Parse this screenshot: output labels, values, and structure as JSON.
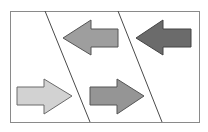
{
  "diagram": {
    "background": "#ffffff",
    "frame": {
      "x": 10,
      "y": 11,
      "width": 189,
      "height": 111,
      "stroke": "#8a8a8a"
    },
    "dividers": [
      {
        "x1": 45,
        "y1": 11,
        "x2": 90,
        "y2": 122,
        "stroke": "#4a4a4a"
      },
      {
        "x1": 118,
        "y1": 11,
        "x2": 162,
        "y2": 122,
        "stroke": "#4a4a4a"
      }
    ],
    "arrows": [
      {
        "id": "arrow-top-middle",
        "direction": "left",
        "fill": "#9e9e9e",
        "stroke": "#555555",
        "points": "63,38 91,20 91,29 118,29 118,47 91,47 91,55"
      },
      {
        "id": "arrow-top-right",
        "direction": "left",
        "fill": "#6b6b6b",
        "stroke": "#444444",
        "points": "136,38 163,20 163,29 191,29 191,47 163,47 163,55"
      },
      {
        "id": "arrow-bottom-left",
        "direction": "right",
        "fill": "#d2d2d2",
        "stroke": "#6a6a6a",
        "points": "17,87 44,87 44,79 72,96 44,114 44,105 17,105"
      },
      {
        "id": "arrow-bottom-middle",
        "direction": "right",
        "fill": "#959595",
        "stroke": "#555555",
        "points": "90,87 117,87 117,79 144,96 117,114 117,105 90,105"
      }
    ]
  }
}
